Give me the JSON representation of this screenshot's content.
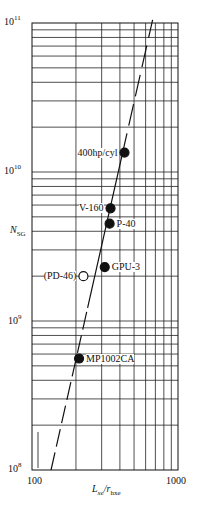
{
  "chart_data": {
    "type": "scatter",
    "title": "",
    "xlabel": "Lxe/rhxe",
    "xlabel_main": "L",
    "xlabel_sub1": "xe",
    "xlabel_sep": "/r",
    "xlabel_sub2": "hxe",
    "ylabel": "NSG",
    "ylabel_main": "N",
    "ylabel_sub": "SG",
    "x_scale": "log",
    "y_scale": "log",
    "xlim": [
      100,
      1000
    ],
    "ylim": [
      100000000.0,
      100000000000.0
    ],
    "x_ticks": [
      "100",
      "1000"
    ],
    "y_ticks": [
      {
        "base": "10",
        "exp": "8"
      },
      {
        "base": "10",
        "exp": "9"
      },
      {
        "base": "10",
        "exp": "10"
      },
      {
        "base": "10",
        "exp": "11"
      }
    ],
    "grid": true,
    "points": [
      {
        "label": "400hp/cyl",
        "x": 430,
        "y": 13500000000.0,
        "filled": true
      },
      {
        "label": "V-160",
        "x": 345,
        "y": 5700000000.0,
        "filled": true
      },
      {
        "label": "P-40",
        "x": 340,
        "y": 4500000000.0,
        "filled": true
      },
      {
        "label": "GPU-3",
        "x": 315,
        "y": 2300000000.0,
        "filled": true
      },
      {
        "label": "(PD-46)",
        "x": 225,
        "y": 2000000000.0,
        "filled": false
      },
      {
        "label": "MP1002CA",
        "x": 210,
        "y": 560000000.0,
        "filled": true
      }
    ],
    "fit_line": {
      "style": "solid within data, dashed extrapolation",
      "x_start": 135,
      "y_start": 100000000.0,
      "x_end": 670,
      "y_end": 105000000000.0
    }
  }
}
